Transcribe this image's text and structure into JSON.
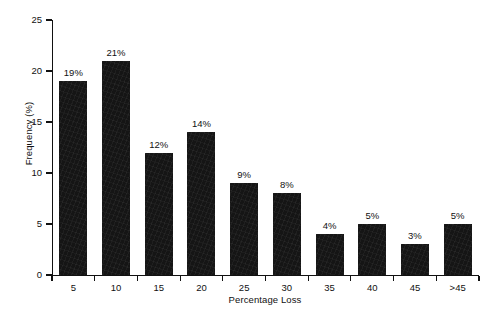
{
  "chart_data": {
    "type": "bar",
    "title": "",
    "subtitle": "",
    "xlabel": "Percentage Loss",
    "ylabel": "Frequency (%)",
    "categories": [
      "5",
      "10",
      "15",
      "20",
      "25",
      "30",
      "35",
      "40",
      "45",
      ">45"
    ],
    "values": [
      19,
      21,
      12,
      14,
      9,
      8,
      4,
      5,
      3,
      5
    ],
    "data_labels": [
      "19%",
      "21%",
      "12%",
      "14%",
      "9%",
      "8%",
      "4%",
      "5%",
      "3%",
      "5%"
    ],
    "ylim": [
      0,
      25
    ],
    "yticks": [
      0,
      5,
      10,
      15,
      20,
      25
    ],
    "ytick_labels": [
      "0",
      "5",
      "10",
      "15",
      "20",
      "25"
    ],
    "grid": false,
    "legend": null,
    "bar_color": "#151515",
    "axis_color": "#111111",
    "background_color": "#ffffff"
  }
}
